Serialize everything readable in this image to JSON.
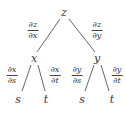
{
  "diagram": {
    "nodes": {
      "root": {
        "label": "z",
        "x": 64,
        "y": 12
      },
      "x": {
        "label": "x",
        "x": 34,
        "y": 58
      },
      "y": {
        "label": "y",
        "x": 97,
        "y": 58
      },
      "xs": {
        "label": "s",
        "x": 18,
        "y": 99
      },
      "xt": {
        "label": "t",
        "x": 46,
        "y": 99
      },
      "ys": {
        "label": "s",
        "x": 82,
        "y": 99
      },
      "yt": {
        "label": "t",
        "x": 112,
        "y": 99
      }
    },
    "edges": [
      {
        "from": "z",
        "to": "x",
        "label": {
          "num": "∂z",
          "den": "∂x"
        }
      },
      {
        "from": "z",
        "to": "y",
        "label": {
          "num": "∂z",
          "den": "∂y"
        }
      },
      {
        "from": "x",
        "to": "s",
        "label": {
          "num": "∂x",
          "den": "∂s"
        }
      },
      {
        "from": "x",
        "to": "t",
        "label": {
          "num": "∂x",
          "den": "∂t"
        }
      },
      {
        "from": "y",
        "to": "s",
        "label": {
          "num": "∂y",
          "den": "∂s"
        }
      },
      {
        "from": "y",
        "to": "t",
        "label": {
          "num": "∂y",
          "den": "∂t"
        }
      }
    ],
    "line_color": "#555555",
    "text_color": "#333333"
  }
}
